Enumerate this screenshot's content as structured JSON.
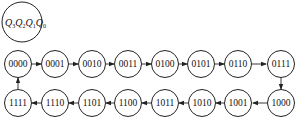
{
  "diagram": {
    "type": "state-transition",
    "legend": {
      "label": "Q3Q2Q1Q0",
      "parts": [
        {
          "main": "Q",
          "sub": "3"
        },
        {
          "main": "Q",
          "sub": "2"
        },
        {
          "main": "Q",
          "sub": "1"
        },
        {
          "main": "Q",
          "sub": "0"
        }
      ]
    },
    "top_row": [
      "0000",
      "0001",
      "0010",
      "0011",
      "0100",
      "0101",
      "0110",
      "0111"
    ],
    "bottom_row": [
      "1111",
      "1110",
      "1101",
      "1100",
      "1011",
      "1010",
      "1001",
      "1000"
    ],
    "transitions": [
      [
        "0000",
        "0001"
      ],
      [
        "0001",
        "0010"
      ],
      [
        "0010",
        "0011"
      ],
      [
        "0011",
        "0100"
      ],
      [
        "0100",
        "0101"
      ],
      [
        "0101",
        "0110"
      ],
      [
        "0110",
        "0111"
      ],
      [
        "0111",
        "1000"
      ],
      [
        "1000",
        "1001"
      ],
      [
        "1001",
        "1010"
      ],
      [
        "1010",
        "1011"
      ],
      [
        "1011",
        "1100"
      ],
      [
        "1100",
        "1101"
      ],
      [
        "1101",
        "1110"
      ],
      [
        "1110",
        "1111"
      ],
      [
        "1111",
        "0000"
      ]
    ],
    "colors": {
      "stroke": "#222222",
      "background": "#ffffff"
    }
  }
}
